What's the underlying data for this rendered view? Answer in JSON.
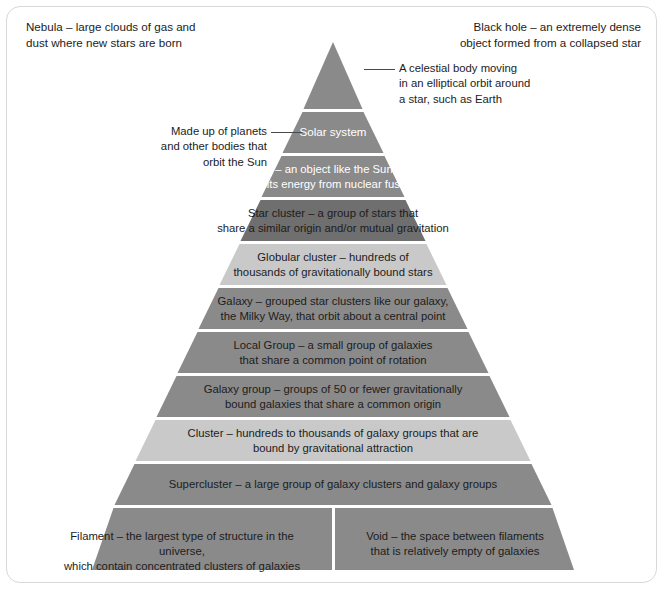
{
  "diagram": {
    "colors": {
      "band_dark": "#6f6f6f",
      "band_mid": "#8a8a8a",
      "band_light": "#c9c9c9",
      "band_lighter": "#d4d4d4",
      "separator": "#ffffff",
      "text_dark": "#1c1c1c",
      "text_light": "#ffffff",
      "frame_border": "#d8d8d8",
      "leader_line": "#4a4a4a",
      "background": "#ffffff"
    },
    "corner_notes": [
      {
        "id": "nebula-note",
        "text": "Nebula – large clouds of gas and\ndust where new stars are born"
      },
      {
        "id": "black-hole-note",
        "text": "Black hole – an extremely dense\nobject formed from a collapsed star"
      }
    ],
    "callouts": [
      {
        "id": "planet-callout",
        "text": "A celestial body moving\nin an elliptical orbit around\na star, such as Earth"
      },
      {
        "id": "solar-system-callout",
        "text": "Made up of planets\nand other bodies that\norbit the Sun"
      }
    ],
    "bands": [
      {
        "id": "planet",
        "label": "Planet",
        "fill": "#8a8a8a",
        "text_color": "#ffffff",
        "font_size": 11.6
      },
      {
        "id": "solar-system",
        "label": "Solar system",
        "fill": "#8a8a8a",
        "text_color": "#ffffff",
        "font_size": 11.6
      },
      {
        "id": "star",
        "label": "Star – an object like the Sun that\nemits energy from nuclear fusion",
        "fill": "#8a8a8a",
        "text_color": "#ffffff",
        "font_size": 11.3
      },
      {
        "id": "star-cluster",
        "label": "Star cluster – a group of stars that\nshare a similar origin and/or mutual gravitation",
        "fill": "#6f6f6f",
        "text_color": "#1c1c1c",
        "font_size": 11.3
      },
      {
        "id": "globular-cluster",
        "label": "Globular cluster – hundreds of\nthousands of gravitationally bound stars",
        "fill": "#c9c9c9",
        "text_color": "#1c1c1c",
        "font_size": 11.3
      },
      {
        "id": "galaxy",
        "label": "Galaxy – grouped star clusters like our galaxy,\nthe Milky Way, that orbit about a central point",
        "fill": "#8a8a8a",
        "text_color": "#1c1c1c",
        "font_size": 11.3
      },
      {
        "id": "local-group",
        "label": "Local Group – a small group of galaxies\nthat share a common point of rotation",
        "fill": "#8a8a8a",
        "text_color": "#1c1c1c",
        "font_size": 11.3
      },
      {
        "id": "galaxy-group",
        "label": "Galaxy group – groups of 50 or fewer gravitationally\nbound galaxies that share a common origin",
        "fill": "#8a8a8a",
        "text_color": "#1c1c1c",
        "font_size": 11.3
      },
      {
        "id": "cluster",
        "label": "Cluster – hundreds to thousands of galaxy groups that are\nbound by gravitational attraction",
        "fill": "#c9c9c9",
        "text_color": "#1c1c1c",
        "font_size": 11.3
      },
      {
        "id": "supercluster",
        "label": "Supercluster – a large group of galaxy clusters and galaxy groups",
        "fill": "#8a8a8a",
        "text_color": "#1c1c1c",
        "font_size": 11.3
      }
    ],
    "bottom_row": [
      {
        "id": "filament",
        "label": "Filament – the largest type of structure in the universe,\nwhich contain concentrated clusters of galaxies",
        "fill": "#8a8a8a",
        "text_color": "#1c1c1c",
        "font_size": 11.3
      },
      {
        "id": "void",
        "label": "Void – the space between filaments\nthat is relatively empty of galaxies",
        "fill": "#8a8a8a",
        "text_color": "#1c1c1c",
        "font_size": 11.3
      }
    ]
  }
}
